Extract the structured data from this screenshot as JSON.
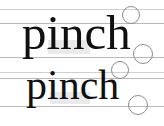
{
  "figure": {
    "kind": "typography-specimen",
    "background_color": "#ffffff",
    "ink_color": "#101010",
    "guide_color": "#b9b9b9",
    "marker_color": "#8d8d8d"
  },
  "specimens": [
    {
      "id": "specimen-upper",
      "word": "pinch",
      "size_label": "49",
      "x": 22,
      "y": 8
    },
    {
      "id": "specimen-lower",
      "word": "pinch",
      "size_label": "42",
      "x": 26,
      "y": 64
    }
  ],
  "guides": [
    {
      "name": "ascender-line-upper",
      "y": 9,
      "width": 164,
      "tone": "faint"
    },
    {
      "name": "cap-line-upper",
      "y": 23,
      "width": 164,
      "tone": "solid"
    },
    {
      "name": "baseline-upper",
      "y": 57,
      "width": 164,
      "tone": "solid"
    },
    {
      "name": "descender-line-upper",
      "y": 72,
      "width": 164,
      "tone": "faint"
    },
    {
      "name": "x-height-line-lower",
      "y": 78,
      "width": 164,
      "tone": "solid"
    },
    {
      "name": "baseline-lower",
      "y": 106,
      "width": 164,
      "tone": "solid"
    }
  ],
  "markers": [
    {
      "name": "marker-h-ascender-upper",
      "cx": 130,
      "cy": 14,
      "r": 8
    },
    {
      "name": "marker-h-baseline-upper",
      "cx": 142,
      "cy": 53,
      "r": 9
    },
    {
      "name": "marker-h-ascender-lower",
      "cx": 119,
      "cy": 69,
      "r": 8
    },
    {
      "name": "marker-h-baseline-lower",
      "cx": 137,
      "cy": 104,
      "r": 9
    }
  ]
}
